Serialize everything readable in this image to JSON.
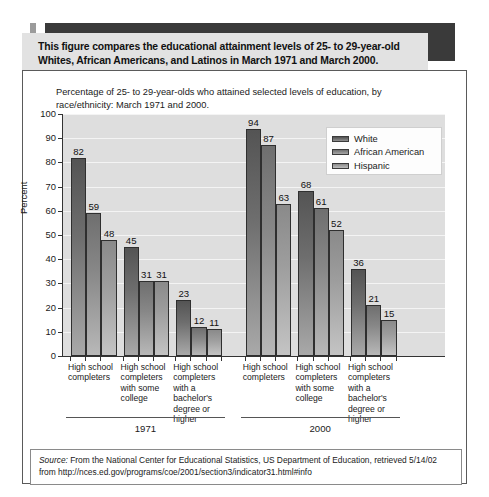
{
  "callout": {
    "text": "This figure compares the educational attainment levels of 25- to 29-year-old Whites, African Americans, and Latinos in March 1971 and March 2000."
  },
  "source": {
    "label": "Source:",
    "text": " From the National Center for Educational Statistics, US Department of Education, retrieved 5/14/02 from http://nces.ed.gov/programs/coe/2001/section3/indicator31.html#info"
  },
  "chart_data": {
    "type": "bar",
    "title": "Percentage of 25- to 29-year-olds who attained selected levels of education, by race/ethnicity: March 1971 and 2000.",
    "xlabel": "",
    "ylabel": "Percent",
    "ylim": [
      0,
      100
    ],
    "ytick_values": [
      0,
      10,
      20,
      30,
      40,
      50,
      60,
      70,
      80,
      90,
      100
    ],
    "grid": true,
    "legend_position": "top-right",
    "groups": [
      "1971",
      "2000"
    ],
    "categories": [
      "High school completers",
      "High school completers with some college",
      "High school completers with a bachelor's degree or higher"
    ],
    "series": [
      {
        "name": "White",
        "color": "#5a5a5a",
        "values_1971": [
          82,
          45,
          23
        ],
        "values_2000": [
          94,
          68,
          36
        ]
      },
      {
        "name": "African American",
        "color": "#7d7d7d",
        "values_1971": [
          59,
          31,
          12
        ],
        "values_2000": [
          87,
          61,
          21
        ]
      },
      {
        "name": "Hispanic",
        "color": "#9c9c9c",
        "values_1971": [
          48,
          31,
          11
        ],
        "values_2000": [
          63,
          52,
          15
        ]
      }
    ],
    "all_bars": [
      {
        "group": "1971",
        "category": "High school completers",
        "series": "White",
        "value": 82
      },
      {
        "group": "1971",
        "category": "High school completers",
        "series": "African American",
        "value": 59
      },
      {
        "group": "1971",
        "category": "High school completers",
        "series": "Hispanic",
        "value": 48
      },
      {
        "group": "1971",
        "category": "High school completers with some college",
        "series": "White",
        "value": 45
      },
      {
        "group": "1971",
        "category": "High school completers with some college",
        "series": "African American",
        "value": 31
      },
      {
        "group": "1971",
        "category": "High school completers with some college",
        "series": "Hispanic",
        "value": 31
      },
      {
        "group": "1971",
        "category": "High school completers with a bachelor's degree or higher",
        "series": "White",
        "value": 23
      },
      {
        "group": "1971",
        "category": "High school completers with a bachelor's degree or higher",
        "series": "African American",
        "value": 12
      },
      {
        "group": "1971",
        "category": "High school completers with a bachelor's degree or higher",
        "series": "Hispanic",
        "value": 11
      },
      {
        "group": "2000",
        "category": "High school completers",
        "series": "White",
        "value": 94
      },
      {
        "group": "2000",
        "category": "High school completers",
        "series": "African American",
        "value": 87
      },
      {
        "group": "2000",
        "category": "High school completers",
        "series": "Hispanic",
        "value": 63
      },
      {
        "group": "2000",
        "category": "High school completers with some college",
        "series": "White",
        "value": 68
      },
      {
        "group": "2000",
        "category": "High school completers with some college",
        "series": "African American",
        "value": 61
      },
      {
        "group": "2000",
        "category": "High school completers with some college",
        "series": "Hispanic",
        "value": 52
      },
      {
        "group": "2000",
        "category": "High school completers with a bachelor's degree or higher",
        "series": "White",
        "value": 36
      },
      {
        "group": "2000",
        "category": "High school completers with a bachelor's degree or higher",
        "series": "African American",
        "value": 21
      },
      {
        "group": "2000",
        "category": "High school completers with a bachelor's degree or higher",
        "series": "Hispanic",
        "value": 15
      }
    ]
  }
}
